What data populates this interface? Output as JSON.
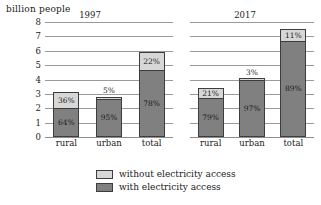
{
  "chart_data": {
    "type": "bar",
    "title": "",
    "ylabel": "billion people",
    "xlabel": "",
    "ylim": [
      0,
      8
    ],
    "yticks": [
      "0",
      "1",
      "2",
      "3",
      "4",
      "5",
      "6",
      "7",
      "8"
    ],
    "grid": true,
    "stacked": true,
    "legend_position": "bottom",
    "legend": [
      {
        "key": "without",
        "label": "without electricity access",
        "color": "#d7d7d7"
      },
      {
        "key": "with",
        "label": "with electricity access",
        "color": "#808080"
      }
    ],
    "panels": [
      {
        "title": "1997",
        "categories": [
          "rural",
          "urban",
          "total"
        ],
        "bars": [
          {
            "category": "rural",
            "total": 3.1,
            "without_pct": "36%",
            "with_pct": "64%",
            "without_share": 0.36,
            "with_share": 0.64,
            "without_label_inside": true
          },
          {
            "category": "urban",
            "total": 2.8,
            "without_pct": "5%",
            "with_pct": "95%",
            "without_share": 0.05,
            "with_share": 0.95,
            "without_label_inside": false
          },
          {
            "category": "total",
            "total": 5.9,
            "without_pct": "22%",
            "with_pct": "78%",
            "without_share": 0.22,
            "with_share": 0.78,
            "without_label_inside": true
          }
        ]
      },
      {
        "title": "2017",
        "categories": [
          "rural",
          "urban",
          "total"
        ],
        "bars": [
          {
            "category": "rural",
            "total": 3.4,
            "without_pct": "21%",
            "with_pct": "79%",
            "without_share": 0.21,
            "with_share": 0.79,
            "without_label_inside": true
          },
          {
            "category": "urban",
            "total": 4.1,
            "without_pct": "3%",
            "with_pct": "97%",
            "without_share": 0.03,
            "with_share": 0.97,
            "without_label_inside": false
          },
          {
            "category": "total",
            "total": 7.5,
            "without_pct": "11%",
            "with_pct": "89%",
            "without_share": 0.11,
            "with_share": 0.89,
            "without_label_inside": true
          }
        ]
      }
    ]
  }
}
